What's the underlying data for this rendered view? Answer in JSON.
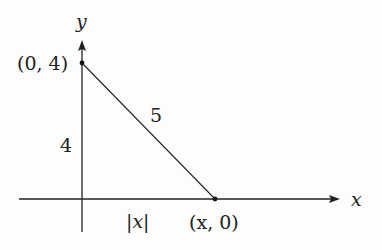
{
  "diagram": {
    "axes": {
      "x_label": "x",
      "y_label": "y"
    },
    "points": [
      {
        "label": "(0, 4)",
        "coord": [
          0,
          4
        ]
      },
      {
        "label": "(x, 0)",
        "coord": [
          "x",
          0
        ]
      }
    ],
    "segments": [
      {
        "from": "(0, 4)",
        "to": "(x, 0)",
        "length_label": "5"
      }
    ],
    "side_labels": {
      "vertical": "4",
      "horizontal": "|x|",
      "hypotenuse": "5"
    },
    "colors": {
      "stroke": "#222222",
      "background": "#fdfdfd"
    }
  }
}
